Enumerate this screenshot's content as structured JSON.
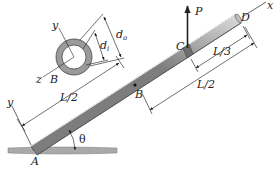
{
  "figure": {
    "type": "engineering-diagram",
    "labels": {
      "A": "A",
      "B": "B",
      "C": "C",
      "D": "D",
      "P": "P",
      "x_axis": "x",
      "y_axis": "y",
      "theta": "θ",
      "L_half_left": "L/2",
      "L_half_right": "L/2",
      "L_third": "L/3"
    },
    "cross_section": {
      "y_axis": "y",
      "z_axis": "z",
      "center_label": "B",
      "inner_diameter": "d",
      "inner_subscript": "i",
      "outer_diameter": "d",
      "outer_subscript": "o"
    },
    "colors": {
      "rod_light": "#e6e6e6",
      "rod_dark": "#8a8a8a",
      "ring_fill": "#9a9a9a",
      "ground": "#a9a9a9",
      "line": "#222222"
    }
  }
}
